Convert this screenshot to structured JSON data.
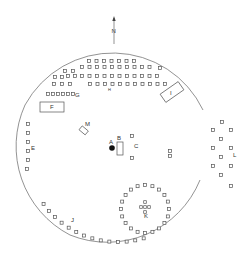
{
  "north_label": "N",
  "labels": {
    "A": "A",
    "B": "B",
    "C": "C",
    "E": "E",
    "F": "F",
    "G": "G",
    "I": "I",
    "J": "J",
    "K": "K",
    "L": "L",
    "M": "M",
    "H": "H"
  },
  "colors": {
    "ink": "#555555",
    "fill": "#111111"
  }
}
